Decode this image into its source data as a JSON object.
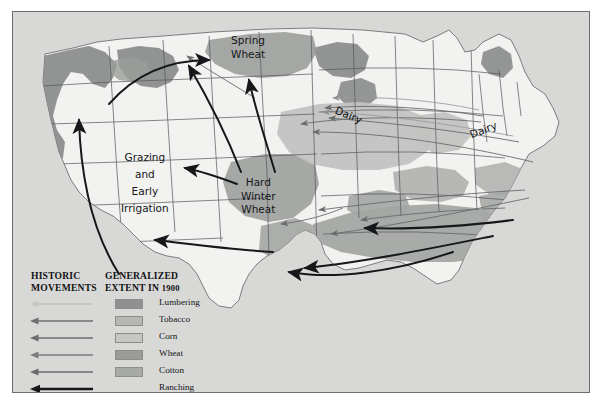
{
  "plate": {
    "background_color": "#d8d8d6",
    "border_color": "#6d6e6c",
    "land_color": "#f2f2f0",
    "water_color": "#d4d4d2"
  },
  "map_labels": {
    "spring_wheat": "Spring\nWheat",
    "grazing": "Grazing\nand\nEarly\nIrrigation",
    "hard_winter_wheat": "Hard\nWinter\nWheat",
    "dairy_upper_midwest": "Dairy",
    "dairy_northeast": "Dairy"
  },
  "legend": {
    "heading_movements": "HISTORIC\nMOVEMENTS",
    "heading_extent": "GENERALIZED\nEXTENT IN ",
    "heading_extent_year": "1900",
    "items": [
      {
        "label": "Lumbering",
        "color": "#8f9190",
        "arrow_color": "#c3c4c2",
        "arrow_width": 1.3,
        "has_swatch": true
      },
      {
        "label": "Tobacco",
        "color": "#b7b8b6",
        "arrow_color": "#6f7170",
        "arrow_width": 1.4,
        "has_swatch": true
      },
      {
        "label": "Corn",
        "color": "#c6c7c5",
        "arrow_color": "#6b6d6c",
        "arrow_width": 1.4,
        "has_swatch": true
      },
      {
        "label": "Wheat",
        "color": "#9a9c9a",
        "arrow_color": "#7b7d7c",
        "arrow_width": 1.4,
        "has_swatch": true
      },
      {
        "label": "Cotton",
        "color": "#a8aaa8",
        "arrow_color": "#6a6c6b",
        "arrow_width": 1.4,
        "has_swatch": true
      },
      {
        "label": "Ranching",
        "color": "#1a1b1d",
        "arrow_color": "#16171a",
        "arrow_width": 2.6,
        "has_swatch": false
      }
    ]
  },
  "chart_data": {
    "type": "map",
    "title": "Generalized Extent in 1900",
    "regions": [
      {
        "name": "Lumbering",
        "fill": "#8f9190",
        "areas": [
          "Pacific Northwest coast",
          "Northern Great Lakes",
          "Northern New England"
        ]
      },
      {
        "name": "Tobacco",
        "fill": "#b7b8b6",
        "areas": [
          "Kentucky",
          "Tennessee",
          "Virginia",
          "North Carolina"
        ]
      },
      {
        "name": "Corn",
        "fill": "#c6c7c5",
        "areas": [
          "Iowa",
          "Illinois",
          "Indiana",
          "Ohio",
          "Missouri",
          "Nebraska"
        ]
      },
      {
        "name": "Wheat",
        "fill": "#9a9c9a",
        "areas": [
          "Spring Wheat northern plains",
          "Hard Winter Wheat central plains",
          "Columbia Plateau"
        ]
      },
      {
        "name": "Cotton",
        "fill": "#a8aaa8",
        "areas": [
          "Deep South",
          "Mississippi Delta",
          "East Texas",
          "Georgia",
          "Carolinas"
        ]
      },
      {
        "name": "Ranching",
        "fill": "#1a1b1d",
        "areas": [
          "Great Plains",
          "Texas",
          "Intermountain West"
        ]
      }
    ],
    "annotations": [
      "Spring Wheat",
      "Hard Winter Wheat",
      "Grazing and Early Irrigation",
      "Dairy",
      "Dairy"
    ],
    "legend_position": "bottom-left"
  }
}
